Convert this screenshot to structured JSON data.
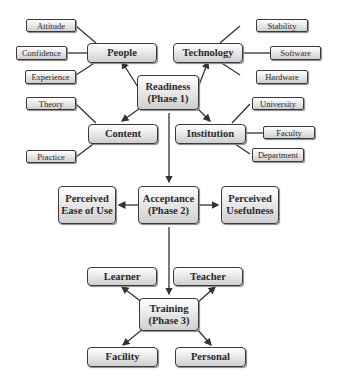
{
  "diagram": {
    "readiness": {
      "line1": "Readiness",
      "line2": "(Phase 1)"
    },
    "people": {
      "label": "People",
      "children": [
        "Attitude",
        "Confidence",
        "Experience"
      ]
    },
    "technology": {
      "label": "Technology",
      "children": [
        "Stability",
        "Software",
        "Hardware"
      ]
    },
    "content": {
      "label": "Content",
      "children": [
        "Theory",
        "Practice"
      ]
    },
    "institution": {
      "label": "Institution",
      "children": [
        "University",
        "Faculty",
        "Department"
      ]
    },
    "acceptance": {
      "line1": "Acceptance",
      "line2": "(Phase 2)"
    },
    "peou": {
      "line1": "Perceived",
      "line2": "Ease of Use"
    },
    "pu": {
      "line1": "Perceived",
      "line2": "Usefulness"
    },
    "training": {
      "line1": "Training",
      "line2": "(Phase 3)"
    },
    "learner": "Learner",
    "teacher": "Teacher",
    "facility": "Facility",
    "personal": "Personal"
  }
}
